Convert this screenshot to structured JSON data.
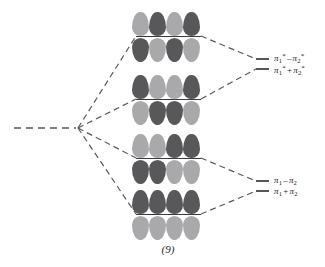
{
  "figure": {
    "caption": "(9)",
    "colors": {
      "lobe_dark": "#58585a",
      "lobe_light": "#a9a9ab",
      "node_line": "#3c3c3e",
      "level_line": "#56565a",
      "correlation_line": "#5a5a5e",
      "text": "#1b1b1b",
      "background": "#ffffff"
    }
  },
  "diagram": {
    "type": "molecular-orbital-correlation-diagram",
    "reactant_level_label": "",
    "orbital_sets": [
      {
        "id": "mo-set-1",
        "name": "pi1-star-minus-pi2-star",
        "top_lobes": [
          "light",
          "dark",
          "light",
          "dark"
        ],
        "bottom_lobes": [
          "dark",
          "light",
          "dark",
          "light"
        ]
      },
      {
        "id": "mo-set-2",
        "name": "pi1-star-plus-pi2-star",
        "top_lobes": [
          "dark",
          "light",
          "light",
          "dark"
        ],
        "bottom_lobes": [
          "light",
          "dark",
          "dark",
          "light"
        ]
      },
      {
        "id": "mo-set-3",
        "name": "pi1-minus-pi2",
        "top_lobes": [
          "light",
          "light",
          "dark",
          "dark"
        ],
        "bottom_lobes": [
          "dark",
          "dark",
          "light",
          "light"
        ]
      },
      {
        "id": "mo-set-4",
        "name": "pi1-plus-pi2",
        "top_lobes": [
          "dark",
          "dark",
          "dark",
          "dark"
        ],
        "bottom_lobes": [
          "light",
          "light",
          "light",
          "light"
        ]
      }
    ],
    "energy_levels": [
      {
        "id": "level-1",
        "label_plain": "π1* - π2*",
        "pi": "π",
        "sub1": "1",
        "sup1": "*",
        "operator": "–",
        "sub2": "2",
        "sup2": "*"
      },
      {
        "id": "level-2",
        "label_plain": "π1* + π2*",
        "pi": "π",
        "sub1": "1",
        "sup1": "*",
        "operator": "+",
        "sub2": "2",
        "sup2": "*"
      },
      {
        "id": "level-3",
        "label_plain": "π1 - π2",
        "pi": "π",
        "sub1": "1",
        "sup1": "",
        "operator": "–",
        "sub2": "2",
        "sup2": ""
      },
      {
        "id": "level-4",
        "label_plain": "π1 + π2",
        "pi": "π",
        "sub1": "1",
        "sup1": "",
        "operator": "+",
        "sub2": "2",
        "sup2": ""
      }
    ]
  }
}
